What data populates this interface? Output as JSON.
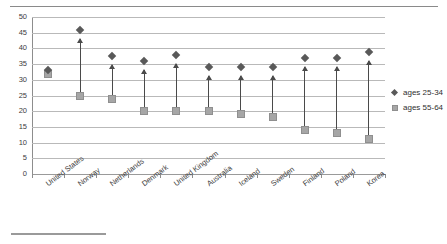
{
  "chart_data": {
    "type": "scatter",
    "title": "",
    "subtitle": "",
    "xlabel": "",
    "ylabel": "",
    "ylim": [
      0,
      50
    ],
    "yticks": [
      0,
      5,
      10,
      15,
      20,
      25,
      30,
      35,
      40,
      45,
      50
    ],
    "grid": true,
    "legend_position": "right",
    "categories": [
      "United States",
      "Norway",
      "Netherlands",
      "Denmark",
      "United Kingdom",
      "Australia",
      "Iceland",
      "Sweden",
      "Finland",
      "Poland",
      "Korea"
    ],
    "series": [
      {
        "name": "ages 25-34",
        "marker": "diamond",
        "color": "#595959",
        "values": [
          33,
          46,
          37.5,
          36,
          38,
          34,
          34,
          34,
          37,
          37,
          39
        ]
      },
      {
        "name": "ages 55-64",
        "marker": "square",
        "color": "#a6a6a6",
        "values": [
          32,
          25,
          24,
          20,
          20,
          20,
          19,
          18,
          14,
          13,
          11
        ]
      }
    ],
    "annotations": {
      "arrows": "Upward arrows connect the ages 55-64 value to the ages 25-34 value for each country",
      "arrow_color": "#4a4a4a"
    }
  },
  "legend": {
    "items": [
      {
        "label": "ages 25-34",
        "marker": "diamond-marker-icon"
      },
      {
        "label": "ages 55-64",
        "marker": "square-marker-icon"
      }
    ]
  },
  "decorations": {
    "top_rule": "horizontal-rule",
    "footnote_rule": "footnote-separator-rule"
  }
}
